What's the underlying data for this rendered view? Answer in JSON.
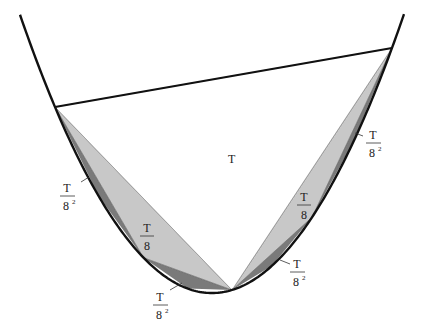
{
  "figure": {
    "colors": {
      "curve": "#111111",
      "triangle_large": "#ffffff",
      "triangle_level1": "#c8c8c8",
      "triangle_level2": "#7a7a7a",
      "text": "#222222"
    },
    "labels": {
      "main_triangle": "T",
      "left_level1": {
        "numerator": "T",
        "denominator": "8"
      },
      "right_level1": {
        "numerator": "T",
        "denominator": "8"
      },
      "left_upper_level2": {
        "numerator": "T",
        "denominator": "8",
        "exponent": "2"
      },
      "left_lower_level2": {
        "numerator": "T",
        "denominator": "8",
        "exponent": "2"
      },
      "right_upper_level2": {
        "numerator": "T",
        "denominator": "8",
        "exponent": "2"
      },
      "right_lower_level2": {
        "numerator": "T",
        "denominator": "8",
        "exponent": "2"
      }
    }
  }
}
